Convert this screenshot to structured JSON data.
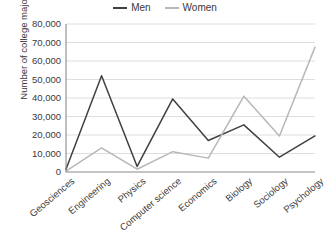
{
  "chart_data": {
    "type": "line",
    "title": "",
    "xlabel": "",
    "ylabel": "Number of college majors",
    "categories": [
      "Geosciences",
      "Engineering",
      "Physics",
      "Computer science",
      "Economics",
      "Biology",
      "Sociology",
      "Psychology"
    ],
    "series": [
      {
        "name": "Men",
        "color": "#404040",
        "values": [
          1500,
          52000,
          3000,
          39500,
          17000,
          25500,
          8000,
          19500
        ]
      },
      {
        "name": "Women",
        "color": "#b8b8b8",
        "values": [
          500,
          13000,
          1500,
          11000,
          7500,
          41000,
          19500,
          67500
        ]
      }
    ],
    "ylim": [
      0,
      80000
    ],
    "ytick_values": [
      0,
      10000,
      20000,
      30000,
      40000,
      50000,
      60000,
      70000,
      80000
    ],
    "ytick_labels": [
      "0",
      "10,000",
      "20,000",
      "30,000",
      "40,000",
      "50,000",
      "60,000",
      "70,000",
      "80,000"
    ],
    "grid": true,
    "grid_axis": "y",
    "legend_position": "top-center",
    "xtick_rotation": -40
  },
  "legend": {
    "entries": [
      {
        "label": "Men"
      },
      {
        "label": "Women"
      }
    ]
  }
}
